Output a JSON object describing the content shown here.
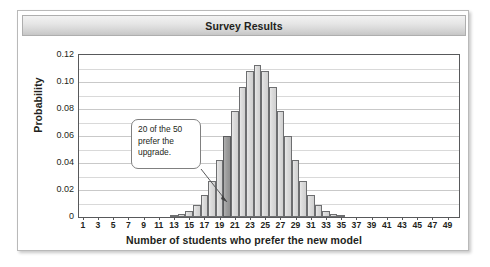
{
  "chart": {
    "title": "Survey Results",
    "xlabel": "Number of students who prefer the new model",
    "ylabel": "Probability"
  },
  "callout": {
    "text": "20 of the 50 prefer the upgrade.",
    "line1": "20 of the 50",
    "line2": "prefer the",
    "line3": "upgrade.",
    "points_to_category": 20
  },
  "colors": {
    "bar_fill": "#dcdcdc",
    "bar_stroke": "#6d6e70",
    "bar_highlight_fill": "#9e9e9e",
    "title_band": "#e6e6e6",
    "text": "#231f20",
    "gridline": "#d9d9d9",
    "frame": "#b9b9b9"
  },
  "chart_data": {
    "type": "bar",
    "title": "Survey Results",
    "xlabel": "Number of students who prefer the new model",
    "ylabel": "Probability",
    "xlim": [
      0,
      50
    ],
    "ylim": [
      0,
      0.12
    ],
    "ytick_labels": [
      "0",
      "0.02",
      "0.04",
      "0.06",
      "0.08",
      "0.10",
      "0.12"
    ],
    "ytick_values": [
      0,
      0.02,
      0.04,
      0.06,
      0.08,
      0.1,
      0.12
    ],
    "minor_gridline_step": 0.01,
    "grid": true,
    "legend": "none",
    "highlight_category": 20,
    "distribution": "Binomial(n=50, p=0.5)",
    "xtick_labels": [
      "1",
      "3",
      "5",
      "7",
      "9",
      "11",
      "13",
      "15",
      "17",
      "19",
      "21",
      "23",
      "25",
      "27",
      "29",
      "31",
      "33",
      "35",
      "37",
      "39",
      "41",
      "43",
      "45",
      "47",
      "49"
    ],
    "categories": [
      1,
      2,
      3,
      4,
      5,
      6,
      7,
      8,
      9,
      10,
      11,
      12,
      13,
      14,
      15,
      16,
      17,
      18,
      19,
      20,
      21,
      22,
      23,
      24,
      25,
      26,
      27,
      28,
      29,
      30,
      31,
      32,
      33,
      34,
      35,
      36,
      37,
      38,
      39,
      40,
      41,
      42,
      43,
      44,
      45,
      46,
      47,
      48,
      49,
      50
    ],
    "values": [
      0.0,
      0.0,
      0.0,
      0.0,
      0.0,
      0.0,
      0.0,
      0.0,
      0.0,
      0.0,
      0.0001,
      0.0003,
      0.0008,
      0.002,
      0.0044,
      0.0087,
      0.016,
      0.027,
      0.0419,
      0.0598,
      0.0788,
      0.096,
      0.108,
      0.1123,
      0.108,
      0.096,
      0.0788,
      0.0598,
      0.0419,
      0.027,
      0.016,
      0.0087,
      0.0044,
      0.002,
      0.0008,
      0.0003,
      0.0001,
      0.0,
      0.0,
      0.0,
      0.0,
      0.0,
      0.0,
      0.0,
      0.0,
      0.0,
      0.0,
      0.0,
      0.0,
      0.0
    ]
  }
}
